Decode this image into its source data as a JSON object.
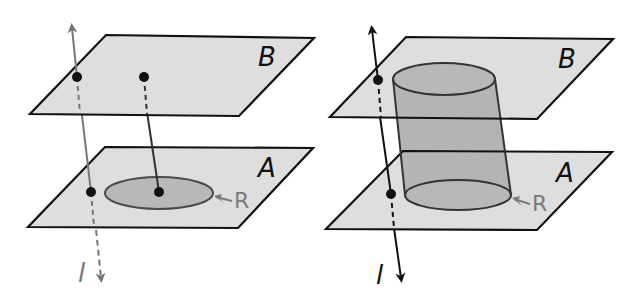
{
  "diagram": {
    "colors": {
      "plane_fill": "#dedede",
      "plane_stroke": "#111111",
      "region_fill": "#b8b8b8",
      "region_stroke": "#4a4a4a",
      "cylinder_fill": "#b4b4b4",
      "line_left": "#767676",
      "line_right": "#111111",
      "point": "#111111",
      "label_plane": "#111111",
      "label_region": "#7a7a7a",
      "label_line_left": "#7a7a7a",
      "label_line_right": "#111111"
    },
    "left_figure": {
      "plane_B": {
        "label": "B",
        "points": "106,35 314,38 239,116 30,114",
        "label_pos": [
          258,
          64
        ]
      },
      "plane_A": {
        "label": "A",
        "points": "105,147 313,148 238,228 28,227",
        "label_pos": [
          260,
          176
        ]
      },
      "region_R": {
        "label": "R",
        "cx": 159,
        "cy": 193,
        "rx": 54,
        "ry": 16,
        "label_pos": [
          236,
          204
        ]
      },
      "line_l": {
        "label": "l",
        "label_pos": [
          80,
          279
        ]
      },
      "points": [
        {
          "name": "l-on-B",
          "x": 77,
          "y": 77
        },
        {
          "name": "segment-top-on-B",
          "x": 144,
          "y": 77
        },
        {
          "name": "l-on-A",
          "x": 91,
          "y": 192
        },
        {
          "name": "segment-bottom-in-R",
          "x": 159,
          "y": 192
        }
      ]
    },
    "right_figure": {
      "plane_B": {
        "label": "B",
        "points": "406,37 613,39 537,119 330,117",
        "label_pos": [
          560,
          67
        ]
      },
      "plane_A": {
        "label": "A",
        "points": "403,151 612,152 537,230 326,229",
        "label_pos": [
          558,
          181
        ]
      },
      "cylinder": {
        "top": {
          "cx": 444,
          "cy": 79,
          "rx": 51,
          "ry": 16
        },
        "bottom": {
          "cx": 458,
          "cy": 195,
          "rx": 53,
          "ry": 15
        }
      },
      "region_R": {
        "label": "R",
        "label_pos": [
          534,
          207
        ]
      },
      "line_l": {
        "label": "l",
        "label_pos": [
          378,
          281
        ]
      },
      "points": [
        {
          "name": "l-on-B",
          "x": 378,
          "y": 80
        },
        {
          "name": "l-on-A",
          "x": 391,
          "y": 194
        }
      ]
    }
  }
}
